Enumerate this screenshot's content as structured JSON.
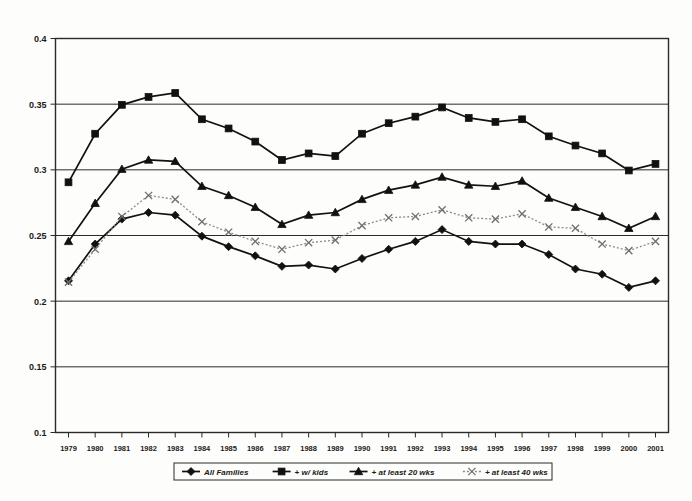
{
  "chart_data": {
    "type": "line",
    "title": "",
    "xlabel": "",
    "ylabel": "",
    "grid": true,
    "legend_position": "bottom",
    "xlim": [
      1979,
      2001
    ],
    "ylim": [
      0.1,
      0.4
    ],
    "ytick_step": 0.05,
    "categories": [
      1979,
      1980,
      1981,
      1982,
      1983,
      1984,
      1985,
      1986,
      1987,
      1988,
      1989,
      1990,
      1991,
      1992,
      1993,
      1994,
      1995,
      1996,
      1997,
      1998,
      1999,
      2000,
      2001
    ],
    "x_tick_labels": [
      "1979",
      "1980",
      "1981",
      "1982",
      "1983",
      "1984",
      "1985",
      "1986",
      "1987",
      "1988",
      "1989",
      "1990",
      "1991",
      "1992",
      "1993",
      "1994",
      "1995",
      "1996",
      "1997",
      "1998",
      "1999",
      "2000",
      "2001"
    ],
    "y_tick_labels": [
      "0.4",
      "0.35",
      "0.3",
      "0.25",
      "0.2",
      "0.15",
      "0.1"
    ],
    "y_tick_values": [
      0.4,
      0.35,
      0.3,
      0.25,
      0.2,
      0.15,
      0.1
    ],
    "series": [
      {
        "name": "All Families",
        "marker": "diamond",
        "line_style": "solid",
        "color": "#111111",
        "values": [
          0.2155,
          0.2435,
          0.2625,
          0.2675,
          0.2655,
          0.2495,
          0.2415,
          0.2345,
          0.2265,
          0.2275,
          0.2245,
          0.2325,
          0.2395,
          0.2455,
          0.2545,
          0.2455,
          0.2435,
          0.2435,
          0.2355,
          0.2245,
          0.2205,
          0.2105,
          0.2155
        ]
      },
      {
        "name": "+ w/ kids",
        "marker": "square",
        "line_style": "solid",
        "color": "#111111",
        "values": [
          0.2905,
          0.3275,
          0.3495,
          0.3555,
          0.3585,
          0.3385,
          0.3315,
          0.3215,
          0.3075,
          0.3125,
          0.3105,
          0.3275,
          0.3355,
          0.3405,
          0.3475,
          0.3395,
          0.3365,
          0.3385,
          0.3255,
          0.3185,
          0.3125,
          0.2995,
          0.3045
        ]
      },
      {
        "name": "+ at least 20 wks",
        "marker": "triangle",
        "line_style": "solid",
        "color": "#111111",
        "values": [
          0.2455,
          0.2745,
          0.3005,
          0.3075,
          0.3065,
          0.2875,
          0.2805,
          0.2715,
          0.2585,
          0.2655,
          0.2675,
          0.2775,
          0.2845,
          0.2885,
          0.2945,
          0.2885,
          0.2875,
          0.2915,
          0.2785,
          0.2715,
          0.2645,
          0.2555,
          0.2645
        ]
      },
      {
        "name": "+ at least 40 wks",
        "marker": "x",
        "line_style": "dotted",
        "color": "#8a8a8a",
        "values": [
          0.2145,
          0.2395,
          0.2645,
          0.2805,
          0.2775,
          0.2605,
          0.2525,
          0.2455,
          0.2395,
          0.2445,
          0.2465,
          0.2575,
          0.2635,
          0.2645,
          0.2695,
          0.2635,
          0.2625,
          0.2665,
          0.2565,
          0.2555,
          0.2435,
          0.2385,
          0.2455
        ]
      }
    ]
  },
  "legend": {
    "entries": [
      {
        "label": "All Families"
      },
      {
        "label": "+ w/ kids"
      },
      {
        "label": "+ at least 20 wks"
      },
      {
        "label": "+ at least 40 wks"
      }
    ]
  }
}
